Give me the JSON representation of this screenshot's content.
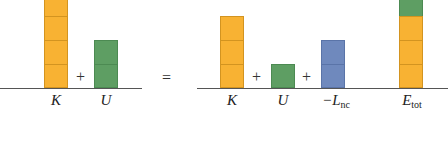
{
  "diagram": {
    "colors": {
      "kinetic": "#f8b233",
      "potential": "#5e9e63",
      "nonconservative": "#6f89bd",
      "baseline": "#555555"
    },
    "left_side": {
      "bars": [
        {
          "name": "K",
          "label": "K",
          "color": "orange",
          "blocks": 4,
          "partial_top_clipped": true
        },
        {
          "name": "U",
          "label": "U",
          "color": "green",
          "blocks": 2
        }
      ],
      "operators": [
        "+"
      ]
    },
    "equals": "=",
    "right_side": {
      "bars": [
        {
          "name": "K",
          "label": "K",
          "color": "orange",
          "blocks": 3
        },
        {
          "name": "U",
          "label": "U",
          "color": "green",
          "blocks": 1
        },
        {
          "name": "-Lnc",
          "label_main": "−L",
          "label_sub": "nc",
          "color": "blue",
          "blocks": 2
        },
        {
          "name": "Etot",
          "label_main": "E",
          "label_sub": "tot",
          "segments": [
            {
              "color": "orange",
              "blocks": 3
            },
            {
              "color": "green",
              "blocks": 1
            }
          ]
        }
      ],
      "operators": [
        "+",
        "+"
      ]
    }
  }
}
